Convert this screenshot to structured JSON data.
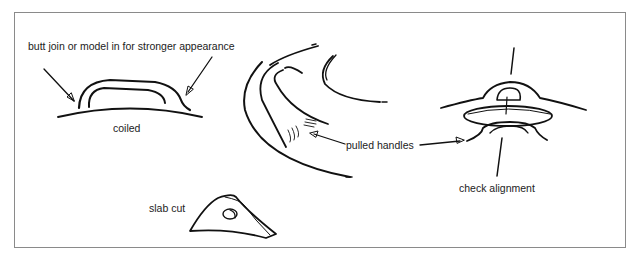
{
  "labels": {
    "butt_join": "butt join or model in for stronger appearance",
    "coiled": "coiled",
    "pulled_handles": "pulled handles",
    "check_alignment": "check alignment",
    "slab_cut": "slab cut"
  },
  "illustrations": [
    {
      "name": "coiled-handle",
      "caption": "coiled"
    },
    {
      "name": "pulled-handles",
      "caption": "pulled handles"
    },
    {
      "name": "lid-knob-alignment",
      "caption": "check alignment"
    },
    {
      "name": "slab-cut-handle",
      "caption": "slab cut"
    }
  ]
}
